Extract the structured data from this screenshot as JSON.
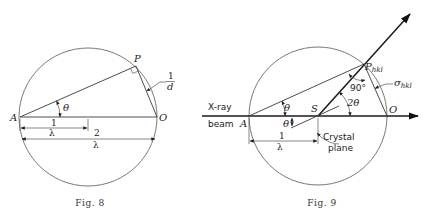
{
  "figures": [
    {
      "id": "fig8",
      "caption": "Fig. 8",
      "labels": {
        "point_A": "A",
        "point_P": "P",
        "point_O": "O",
        "angle": "θ",
        "chord_num": "1",
        "chord_den": "d",
        "dim1_num": "1",
        "dim1_den": "λ",
        "dim2_num": "2",
        "dim2_den": "λ"
      }
    },
    {
      "id": "fig9",
      "caption": "Fig. 9",
      "labels": {
        "xray": "X-ray",
        "beam": "beam",
        "point_A": "A",
        "point_S": "S",
        "point_O": "O",
        "point_P": "P",
        "point_P_sub": "hkl",
        "angle_theta_upper": "θ",
        "angle_theta_lower": "θ",
        "angle_2theta": "2θ",
        "angle_90": "90°",
        "sigma": "σ",
        "sigma_sub": "hkl",
        "crystal_plane_line1": "Crystal",
        "crystal_plane_line2": "plane",
        "dim_num": "1",
        "dim_den": "λ"
      }
    }
  ]
}
